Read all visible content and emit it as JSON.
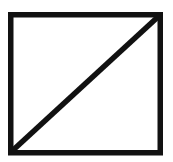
{
  "figure": {
    "type": "image-placeholder",
    "shape": "rectangle-with-diagonal",
    "stroke_color": "#111111",
    "background_color": "#ffffff",
    "stroke_width": 5.5,
    "rect": {
      "x": 10.75,
      "y": 14.75,
      "width": 149.5,
      "height": 138
    },
    "diagonal": {
      "x1": 11,
      "y1": 152,
      "x2": 160,
      "y2": 15
    }
  }
}
